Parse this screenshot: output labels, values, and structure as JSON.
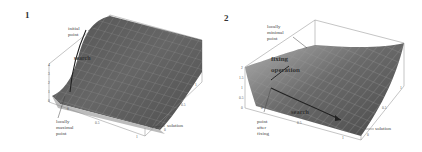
{
  "figure": {
    "panels": [
      {
        "number": "1",
        "labels": {
          "initial_point": [
            "initial",
            "point"
          ],
          "search": "search",
          "locally_maximal_point": [
            "locally",
            "maximal",
            "point"
          ],
          "solution": "solution"
        },
        "ticks": {
          "z": [
            "4",
            "3",
            "2",
            "1",
            "0"
          ],
          "x": [
            "0",
            "0.5",
            "1"
          ],
          "y": [
            "0",
            "0.5",
            "1"
          ]
        }
      },
      {
        "number": "2",
        "labels": {
          "locally_minimal_point": [
            "locally",
            "minimal",
            "point"
          ],
          "fixing_operation": [
            "fixing",
            "operation"
          ],
          "point_after_fixing": [
            "point",
            "after",
            "fixing"
          ],
          "search": "search",
          "solution": "solution"
        },
        "ticks": {
          "z": [
            "2",
            "1.5",
            "1",
            "0.5",
            "0"
          ],
          "x": [
            "0",
            "0.5",
            "1"
          ],
          "y": [
            "0",
            "0.5",
            "1"
          ]
        }
      }
    ],
    "colors": {
      "surface_dark": "#5a5a5a",
      "surface_mid": "#7a7a7a",
      "surface_light": "#a8a8a8",
      "mesh": "#9a9a9a",
      "box": "#888888",
      "arrow": "#222222"
    }
  }
}
